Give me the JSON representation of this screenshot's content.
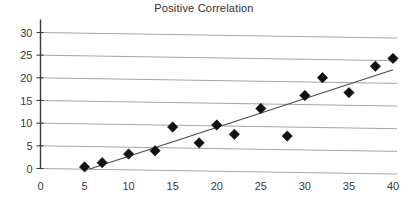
{
  "chart_data": {
    "type": "scatter",
    "title": "Positive Correlation",
    "xlabel": "",
    "ylabel": "",
    "xlim": [
      0,
      40
    ],
    "ylim": [
      0,
      30
    ],
    "xticks": [
      0,
      5,
      10,
      15,
      20,
      25,
      30,
      35,
      40
    ],
    "yticks": [
      0,
      5,
      10,
      15,
      20,
      25,
      30
    ],
    "grid": "horizontal",
    "legend": "none",
    "marker": "diamond",
    "marker_color": "#111111",
    "gridline_color": "#9a9a9a",
    "axis_color": "#3b3b3b",
    "trendline_color": "#4a4a4a",
    "x": [
      5,
      7,
      10,
      13,
      15,
      18,
      20,
      22,
      25,
      28,
      30,
      32,
      35,
      38,
      40
    ],
    "y": [
      0.5,
      1.5,
      3.5,
      4.3,
      9.6,
      6.2,
      10.2,
      8.2,
      14.0,
      8.0,
      17.0,
      21.0,
      17.8,
      23.7,
      25.5
    ],
    "points": [
      {
        "x": 5,
        "y": 0.5
      },
      {
        "x": 7,
        "y": 1.5
      },
      {
        "x": 10,
        "y": 3.5
      },
      {
        "x": 13,
        "y": 4.3
      },
      {
        "x": 15,
        "y": 9.6
      },
      {
        "x": 18,
        "y": 6.2
      },
      {
        "x": 20,
        "y": 10.2
      },
      {
        "x": 22,
        "y": 8.2
      },
      {
        "x": 25,
        "y": 14.0
      },
      {
        "x": 28,
        "y": 8.0
      },
      {
        "x": 30,
        "y": 17.0
      },
      {
        "x": 32,
        "y": 21.0
      },
      {
        "x": 35,
        "y": 17.8
      },
      {
        "x": 38,
        "y": 23.7
      },
      {
        "x": 40,
        "y": 25.5
      }
    ],
    "trendline": {
      "x0": 5.5,
      "y0": 0.0,
      "x1": 40.0,
      "y1": 23.0
    }
  }
}
